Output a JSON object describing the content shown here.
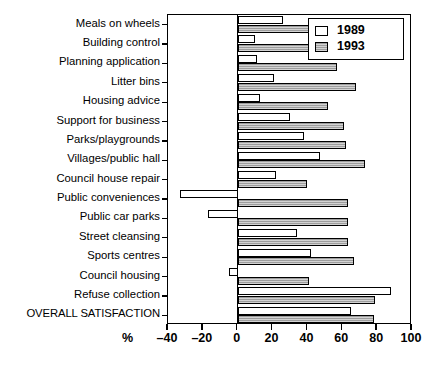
{
  "chart_data": {
    "type": "bar",
    "orientation": "horizontal",
    "title": "",
    "subtitle": "",
    "xlabel": "%",
    "ylabel": "",
    "xlim": [
      -40,
      100
    ],
    "xticks": [
      -40,
      -20,
      0,
      20,
      40,
      60,
      80,
      100
    ],
    "xtick_labels": [
      "–40",
      "–20",
      "0",
      "20",
      "40",
      "60",
      "80",
      "100"
    ],
    "grid": false,
    "legend_position": "top-right",
    "categories": [
      "Meals on wheels",
      "Building control",
      "Planning application",
      "Litter bins",
      "Housing advice",
      "Support for business",
      "Parks/playgrounds",
      "Villages/public hall",
      "Council house repair",
      "Public conveniences",
      "Public car parks",
      "Street cleansing",
      "Sports centres",
      "Council housing",
      "Refuse collection",
      "OVERALL SATISFACTION"
    ],
    "series": [
      {
        "name": "1989",
        "color": "#ffffff",
        "values": [
          26,
          10,
          11,
          21,
          13,
          30,
          38,
          47,
          22,
          -33,
          -17,
          34,
          42,
          -5,
          88,
          65
        ]
      },
      {
        "name": "1993",
        "color": "#9d9d9d",
        "values": [
          45,
          57,
          57,
          68,
          52,
          61,
          62,
          73,
          40,
          63,
          63,
          63,
          67,
          41,
          79,
          78
        ]
      }
    ]
  },
  "legend": {
    "entries": [
      {
        "label": "1989"
      },
      {
        "label": "1993"
      }
    ]
  }
}
